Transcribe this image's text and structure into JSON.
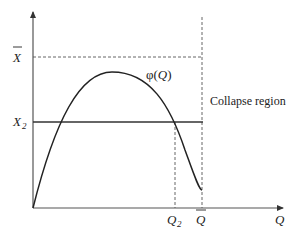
{
  "diagram": {
    "type": "economic-curve-diagram",
    "axes": {
      "x_label": "Q",
      "y_label": ""
    },
    "y_ticks": [
      {
        "label": "X",
        "accent": "bar",
        "name": "x-bar",
        "y": 57
      },
      {
        "label": "X",
        "subscript": "2",
        "name": "x-2",
        "y": 122
      }
    ],
    "x_ticks": [
      {
        "label": "Q",
        "subscript": "2",
        "name": "q-2",
        "x": 175
      },
      {
        "label": "Q",
        "accent": "bar",
        "name": "q-bar",
        "x": 202
      }
    ],
    "curve": {
      "label_func": "φ(",
      "label_arg": "Q",
      "label_close": ")",
      "shape": "inverted-U"
    },
    "horizontal_line_label": "X2 level",
    "region_label": "Collapse region",
    "colors": {
      "curve": "#222222",
      "axis": "#444444",
      "dashed": "#555555",
      "text": "#222222"
    }
  }
}
